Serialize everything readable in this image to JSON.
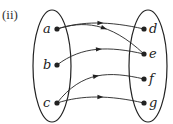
{
  "diagram": {
    "label": "(ii)",
    "domain_set": {
      "elements": [
        {
          "name": "a",
          "x": 57,
          "y": 29
        },
        {
          "name": "b",
          "x": 57,
          "y": 65
        },
        {
          "name": "c",
          "x": 57,
          "y": 103
        }
      ]
    },
    "codomain_set": {
      "elements": [
        {
          "name": "d",
          "x": 144,
          "y": 29
        },
        {
          "name": "e",
          "x": 144,
          "y": 54
        },
        {
          "name": "f",
          "x": 144,
          "y": 79
        },
        {
          "name": "g",
          "x": 144,
          "y": 103
        }
      ]
    },
    "mappings": [
      {
        "from": "a",
        "to": "d"
      },
      {
        "from": "a",
        "to": "e"
      },
      {
        "from": "b",
        "to": "e"
      },
      {
        "from": "c",
        "to": "f"
      },
      {
        "from": "c",
        "to": "g"
      }
    ],
    "colors": {
      "stroke": "#222222",
      "background": "#ffffff"
    }
  }
}
